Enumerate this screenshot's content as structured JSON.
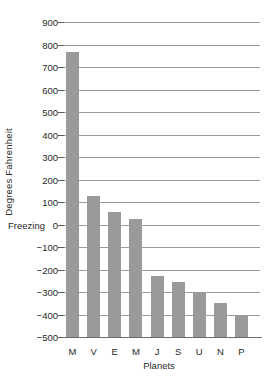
{
  "chart_data": {
    "type": "bar",
    "title": "",
    "subtitle": "",
    "xlabel": "Planets",
    "ylabel": "Degrees Fahrenheit",
    "categories": [
      "M",
      "V",
      "E",
      "M",
      "J",
      "S",
      "U",
      "N",
      "P"
    ],
    "values": [
      765,
      125,
      57,
      23,
      -230,
      -255,
      -300,
      -350,
      -400
    ],
    "series": [
      {
        "name": "Surface temperature",
        "values": [
          765,
          125,
          57,
          23,
          -230,
          -255,
          -300,
          -350,
          -400
        ]
      }
    ],
    "ylim": [
      -500,
      900
    ],
    "ytick_labels": [
      "900",
      "800",
      "700",
      "600",
      "500",
      "400",
      "300",
      "200",
      "100",
      "0",
      "−100",
      "−200",
      "−300",
      "−400",
      "−500"
    ],
    "ytick_values": [
      900,
      800,
      700,
      600,
      500,
      400,
      300,
      200,
      100,
      0,
      -100,
      -200,
      -300,
      -400,
      -500
    ],
    "grid": true,
    "grid_axis": "y",
    "legend": false,
    "legend_position": "none",
    "annotations": [
      {
        "text": "Freezing",
        "value": 0,
        "axis": "y"
      }
    ],
    "bar_color": "#9a9a9a",
    "grid_color": "#9b9b9b",
    "axis_color": "#6d6d6d",
    "background_color": "#ffffff"
  }
}
